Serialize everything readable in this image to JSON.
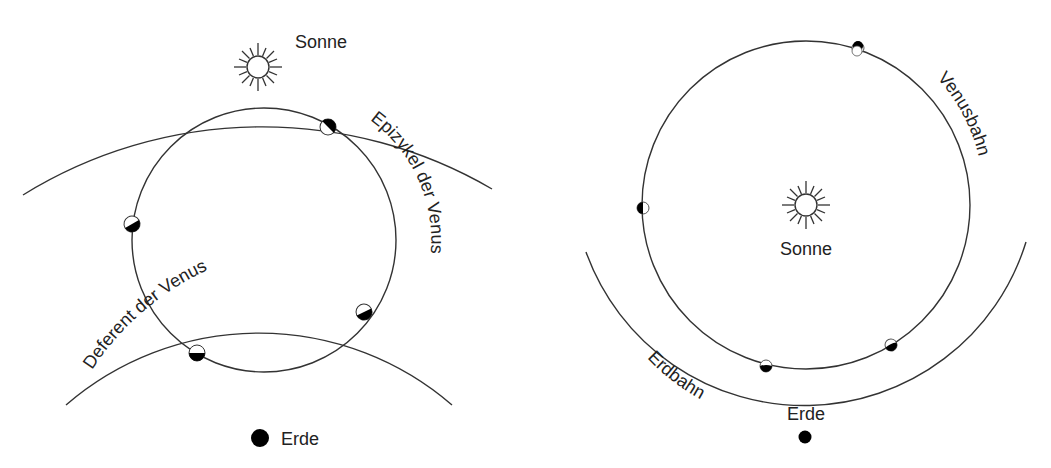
{
  "colors": {
    "background": "#ffffff",
    "line": "#333333",
    "text": "#222222",
    "planet_dark": "#000000",
    "planet_light": "#ffffff"
  },
  "left_panel": {
    "title": "Geocentric model (Ptolemy)",
    "sun_label": "Sonne",
    "epicycle_label": "Epizykel der Venus",
    "deferent_label": "Deferent der Venus",
    "earth_label": "Erde",
    "venus_phases": [
      {
        "position": "upper-right",
        "phase": "half, dark side lower-right"
      },
      {
        "position": "left",
        "phase": "half, dark side lower-left"
      },
      {
        "position": "lower-right",
        "phase": "half, dark side lower"
      },
      {
        "position": "bottom",
        "phase": "half, dark side lower"
      }
    ]
  },
  "right_panel": {
    "title": "Heliocentric model (Copernicus)",
    "sun_label": "Sonne",
    "venus_orbit_label": "Venusbahn",
    "earth_orbit_label": "Erdbahn",
    "earth_label": "Erde",
    "venus_phases": [
      {
        "position": "top",
        "phase": "mostly dark (far side)"
      },
      {
        "position": "left",
        "phase": "half, dark side left"
      },
      {
        "position": "bottom-left",
        "phase": "crescent, dark side lower"
      },
      {
        "position": "bottom-right",
        "phase": "crescent, dark side lower"
      }
    ]
  }
}
